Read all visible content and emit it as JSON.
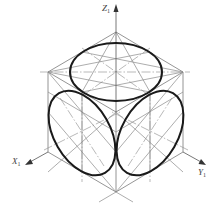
{
  "diagram": {
    "axes": {
      "z": {
        "label": "Z",
        "subscript": "1"
      },
      "x": {
        "label": "X",
        "subscript": "1"
      },
      "y": {
        "label": "Y",
        "subscript": "1"
      }
    },
    "cube_vertices": {
      "top": [
        116,
        32
      ],
      "upper_left": [
        48,
        72
      ],
      "upper_right": [
        183,
        72
      ],
      "front": [
        116,
        112
      ],
      "lower_left": [
        48,
        152
      ],
      "lower_right": [
        183,
        152
      ],
      "bottom": [
        116,
        192
      ]
    },
    "ellipses": [
      {
        "face": "top",
        "center": [
          116,
          72
        ],
        "rx": 46,
        "ry": 28,
        "rotation": 0
      },
      {
        "face": "left",
        "center": [
          82,
          132
        ],
        "rx": 46,
        "ry": 28,
        "rotation": 60
      },
      {
        "face": "right",
        "center": [
          150,
          132
        ],
        "rx": 46,
        "ry": 28,
        "rotation": -60
      }
    ],
    "colors": {
      "outline": "#1a1a1a",
      "construction": "#8a8a8a",
      "background": "#ffffff"
    }
  }
}
